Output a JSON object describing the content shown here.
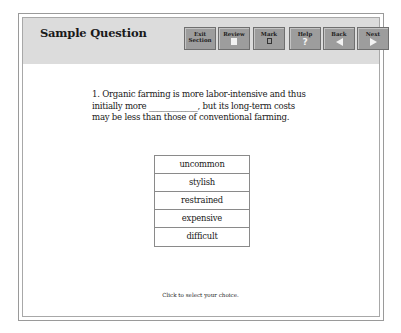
{
  "header": {
    "title": "Sample Question"
  },
  "toolbar": {
    "buttons": [
      {
        "label": "Exit Section",
        "line1": "Exit",
        "line2": "Section",
        "icon": "none"
      },
      {
        "label": "Review",
        "icon": "document-icon"
      },
      {
        "label": "Mark",
        "icon": "checkbox-icon"
      },
      {
        "label": "Help",
        "icon": "question-mark-icon"
      },
      {
        "label": "Back",
        "icon": "arrow-left-icon"
      },
      {
        "label": "Next",
        "icon": "arrow-right-icon"
      }
    ]
  },
  "question": {
    "number": "1.",
    "text": "1. Organic farming is more labor-intensive and thus initially more ____________, but its long-term costs may be less than those of conventional farming.",
    "line1": "1. Organic farming is more labor-intensive and thus",
    "line2": "initially more ____________, but its long-term costs",
    "line3": "may be less than those of conventional farming."
  },
  "choices": [
    {
      "label": "uncommon"
    },
    {
      "label": "stylish"
    },
    {
      "label": "restrained"
    },
    {
      "label": "expensive"
    },
    {
      "label": "difficult"
    }
  ],
  "footer": {
    "instruction": "Click to select your choice."
  },
  "colors": {
    "header_bg": "#dcdcdc",
    "button_bg": "#9d9d9d",
    "border": "#8a8a8a"
  }
}
